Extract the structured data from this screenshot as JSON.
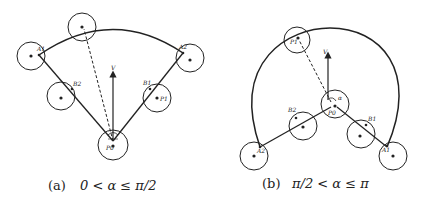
{
  "figure": {
    "panels": [
      {
        "id": "a",
        "caption_tag": "(a)",
        "caption_condition": "0 < α ≤ π/2",
        "labels": {
          "p0": "P0",
          "a1": "A1",
          "a2": "A2",
          "b1": "B1",
          "b2": "B2",
          "p1": "P1",
          "v": "V",
          "angle": "α"
        }
      },
      {
        "id": "b",
        "caption_tag": "(b)",
        "caption_condition": "π/2 < α ≤ π",
        "labels": {
          "p0": "P0",
          "p1": "P1",
          "a1": "A1",
          "a2": "A2",
          "b1": "B1",
          "b2": "B2",
          "v": "V",
          "angle": "α"
        }
      }
    ],
    "colors": {
      "stroke": "#222222",
      "background": "#ffffff"
    }
  }
}
